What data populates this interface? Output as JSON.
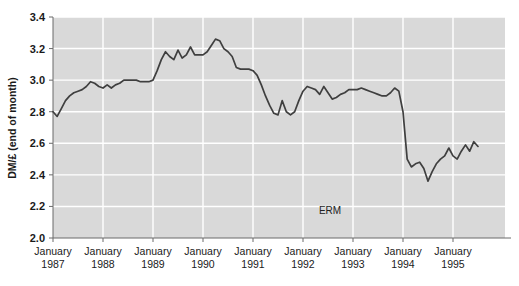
{
  "chart_data": {
    "type": "line",
    "title": "",
    "subtitle": "",
    "xlabel": "",
    "ylabel": "DM/£ (end of month)",
    "ylim": [
      2.0,
      3.4
    ],
    "xlim": [
      "January 1987",
      "July 1995"
    ],
    "grid": true,
    "legend": null,
    "y_ticks": [
      "3.4",
      "3.2",
      "3.0",
      "2.8",
      "2.6",
      "2.4",
      "2.2",
      "2.0"
    ],
    "y_tick_values": [
      3.4,
      3.2,
      3.0,
      2.8,
      2.6,
      2.4,
      2.2,
      2.0
    ],
    "x_ticks": [
      {
        "month": "January",
        "year": "1987"
      },
      {
        "month": "January",
        "year": "1988"
      },
      {
        "month": "January",
        "year": "1989"
      },
      {
        "month": "January",
        "year": "1990"
      },
      {
        "month": "January",
        "year": "1991"
      },
      {
        "month": "January",
        "year": "1992"
      },
      {
        "month": "January",
        "year": "1993"
      },
      {
        "month": "January",
        "year": "1994"
      },
      {
        "month": "January",
        "year": "1995"
      }
    ],
    "annotations": [
      {
        "text": "ERM",
        "x_value": 66.5,
        "y_value": 2.15
      }
    ],
    "series": [
      {
        "name": "DM/£ exchange rate",
        "color": "#3f3f3f",
        "x": [
          0,
          1,
          2,
          3,
          4,
          5,
          6,
          7,
          8,
          9,
          10,
          11,
          12,
          13,
          14,
          15,
          16,
          17,
          18,
          19,
          20,
          21,
          22,
          23,
          24,
          25,
          26,
          27,
          28,
          29,
          30,
          31,
          32,
          33,
          34,
          35,
          36,
          37,
          38,
          39,
          40,
          41,
          42,
          43,
          44,
          45,
          46,
          47,
          48,
          49,
          50,
          51,
          52,
          53,
          54,
          55,
          56,
          57,
          58,
          59,
          60,
          61,
          62,
          63,
          64,
          65,
          66,
          67,
          68,
          69,
          70,
          71,
          72,
          73,
          74,
          75,
          76,
          77,
          78,
          79,
          80,
          81,
          82,
          83,
          84,
          85,
          86,
          87,
          88,
          89,
          90,
          91,
          92,
          93,
          94,
          95,
          96,
          97,
          98,
          99,
          100,
          101,
          102
        ],
        "values": [
          2.8,
          2.77,
          2.82,
          2.87,
          2.9,
          2.92,
          2.93,
          2.94,
          2.96,
          2.99,
          2.98,
          2.96,
          2.95,
          2.97,
          2.95,
          2.97,
          2.98,
          3.0,
          3.0,
          3.0,
          3.0,
          2.99,
          2.99,
          2.99,
          3.0,
          3.06,
          3.13,
          3.18,
          3.15,
          3.13,
          3.19,
          3.14,
          3.16,
          3.21,
          3.16,
          3.16,
          3.16,
          3.18,
          3.22,
          3.26,
          3.25,
          3.2,
          3.18,
          3.15,
          3.08,
          3.07,
          3.07,
          3.07,
          3.06,
          3.03,
          2.97,
          2.9,
          2.84,
          2.79,
          2.78,
          2.87,
          2.8,
          2.78,
          2.8,
          2.87,
          2.93,
          2.96,
          2.95,
          2.94,
          2.91,
          2.96,
          2.92,
          2.88,
          2.89,
          2.91,
          2.92,
          2.94,
          2.94,
          2.94,
          2.95,
          2.94,
          2.93,
          2.92,
          2.91,
          2.9,
          2.9,
          2.92,
          2.95,
          2.93,
          2.8,
          2.5,
          2.45,
          2.47,
          2.48,
          2.44,
          2.36,
          2.42,
          2.47,
          2.5,
          2.52,
          2.57,
          2.52,
          2.5,
          2.55,
          2.59,
          2.55,
          2.61,
          2.58
        ]
      }
    ]
  },
  "chart_style": {
    "plot_background": "#d9d9d9",
    "gridline_color": "#ffffff",
    "axis_color": "#6b6b6b",
    "line_color": "#3f3f3f",
    "text_color": "#1a1a1a",
    "page_background": "#ffffff"
  }
}
